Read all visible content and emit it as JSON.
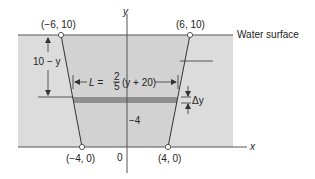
{
  "diagram": {
    "type": "trapezoidal-plate-cross-section",
    "labels": {
      "top_left_point": "(−6, 10)",
      "top_right_point": "(6, 10)",
      "bottom_left_point": "(−4, 0)",
      "bottom_right_point": "(4, 0)",
      "y_axis": "y",
      "x_axis": "x",
      "origin": "0",
      "water_surface": "Water surface",
      "depth": "10 − y",
      "length_prefix": "L =",
      "fraction_num": "2",
      "fraction_den": "5",
      "length_suffix": "(y + 20)",
      "delta_y": "Δy",
      "tick_label": "−4"
    },
    "colors": {
      "water": "#dcdcdc",
      "strip": "#8f8f8f",
      "lines": "#444444",
      "text": "#222222"
    }
  }
}
